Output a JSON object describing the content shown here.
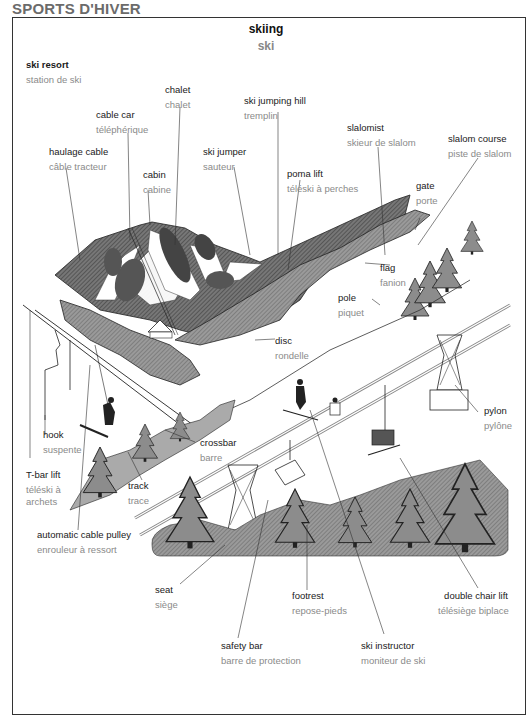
{
  "page": {
    "section_title": "SPORTS D'HIVER",
    "title_en": "skiing",
    "title_fr": "ski"
  },
  "colors": {
    "tree_fill": "#8c8c8c",
    "forest_dark": "#555555",
    "line": "#222222",
    "french_text": "#8a8a8a"
  },
  "labels": {
    "ski_resort": {
      "en": "ski resort",
      "fr": "station de ski"
    },
    "chalet": {
      "en": "chalet",
      "fr": "chalet"
    },
    "cable_car": {
      "en": "cable car",
      "fr": "téléphérique"
    },
    "ski_jumping_hill": {
      "en": "ski jumping hill",
      "fr": "tremplin"
    },
    "haulage_cable": {
      "en": "haulage cable",
      "fr": "câble tracteur"
    },
    "cabin": {
      "en": "cabin",
      "fr": "cabine"
    },
    "ski_jumper": {
      "en": "ski jumper",
      "fr": "sauteur"
    },
    "slalomist": {
      "en": "slalomist",
      "fr": "skieur de slalom"
    },
    "slalom_course": {
      "en": "slalom course",
      "fr": "piste de slalom"
    },
    "poma_lift": {
      "en": "poma lift",
      "fr": "téléski à perches"
    },
    "gate": {
      "en": "gate",
      "fr": "porte"
    },
    "flag": {
      "en": "flag",
      "fr": "fanion"
    },
    "pole": {
      "en": "pole",
      "fr": "piquet"
    },
    "disc": {
      "en": "disc",
      "fr": "rondelle"
    },
    "pylon": {
      "en": "pylon",
      "fr": "pylône"
    },
    "hook": {
      "en": "hook",
      "fr": "suspente"
    },
    "crossbar": {
      "en": "crossbar",
      "fr": "barre"
    },
    "t_bar_lift": {
      "en": "T-bar lift",
      "fr": "téléski à",
      "fr2": "archets"
    },
    "track": {
      "en": "track",
      "fr": "trace"
    },
    "automatic_cable_pulley": {
      "en": "automatic cable pulley",
      "fr": "enrouleur à ressort"
    },
    "seat": {
      "en": "seat",
      "fr": "siège"
    },
    "footrest": {
      "en": "footrest",
      "fr": "repose-pieds"
    },
    "double_chair_lift": {
      "en": "double chair lift",
      "fr": "télésiège biplace"
    },
    "safety_bar": {
      "en": "safety bar",
      "fr": "barre de protection"
    },
    "ski_instructor": {
      "en": "ski instructor",
      "fr": "moniteur de ski"
    }
  }
}
